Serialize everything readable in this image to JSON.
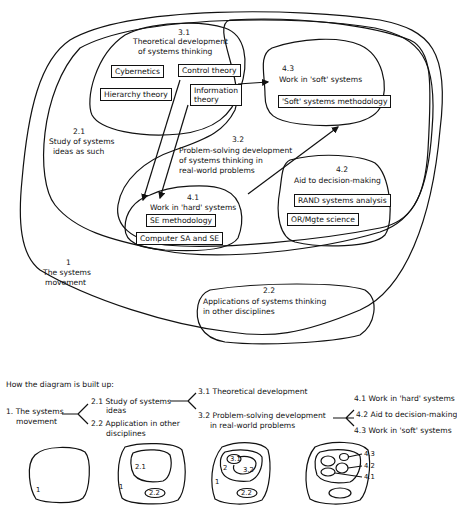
{
  "diagram": {
    "regions": [
      {
        "id": "1",
        "number": "1",
        "label_lines": [
          "The systems",
          "movement"
        ]
      },
      {
        "id": "2.1",
        "number": "2.1",
        "label_lines": [
          "Study of systems",
          "ideas as such"
        ]
      },
      {
        "id": "2.2",
        "number": "2.2",
        "label_lines": [
          "Applications of systems thinking",
          "in other disciplines"
        ]
      },
      {
        "id": "3.1",
        "number": "3.1",
        "label_lines": [
          "Theoretical development",
          "of systems thinking"
        ]
      },
      {
        "id": "3.2",
        "number": "3.2",
        "label_lines": [
          "Problem-solving development",
          "of systems thinking in",
          "real-world problems"
        ]
      },
      {
        "id": "4.1",
        "number": "4.1",
        "label_lines": [
          "Work in 'hard' systems"
        ]
      },
      {
        "id": "4.2",
        "number": "4.2",
        "label_lines": [
          "Aid to decision-making"
        ]
      },
      {
        "id": "4.3",
        "number": "4.3",
        "label_lines": [
          "Work in 'soft' systems"
        ]
      }
    ],
    "boxes": {
      "cybernetics": "Cybernetics",
      "control_theory": "Control theory",
      "hierarchy_theory": "Hierarchy theory",
      "information_theory_1": "Information",
      "information_theory_2": "theory",
      "soft_systems_methodology": "'Soft' systems methodology",
      "se_methodology": "SE methodology",
      "computer_sa_se": "Computer SA and SE",
      "rand_systems_analysis": "RAND systems analysis",
      "or_mgte_science": "OR/Mgte science"
    },
    "arrows": [
      {
        "from": "Control theory",
        "to": "4.1"
      },
      {
        "from": "Information theory",
        "to": "4.1"
      },
      {
        "from": "3.1",
        "to": "4.3"
      },
      {
        "from": "4.1",
        "to": "4.3"
      }
    ]
  },
  "buildup": {
    "heading": "How the diagram is built up:",
    "level1": {
      "line1": "1. The systems",
      "line2": "movement"
    },
    "level2": [
      {
        "line1": "2.1 Study of systems",
        "line2": "ideas"
      },
      {
        "line1": "2.2 Application in other",
        "line2": "disciplines"
      }
    ],
    "level3": [
      {
        "line1": "3.1 Theoretical development",
        "line2": ""
      },
      {
        "line1": "3.2 Problem-solving development",
        "line2": "in real-world problems"
      }
    ],
    "level4": [
      {
        "line1": "4.1 Work in 'hard' systems"
      },
      {
        "line1": "4.2 Aid to decision-making"
      },
      {
        "line1": "4.3 Work in 'soft' systems"
      }
    ],
    "mini_labels": {
      "m1": "1",
      "m2_1": "1",
      "m2_21": "2.1",
      "m2_22": "2.2",
      "m3_1": "1",
      "m3_2": "2",
      "m3_31": "3.1",
      "m3_32": "3.2",
      "m3_22": "2.2",
      "m4_43": "4.3",
      "m4_42": "4.2",
      "m4_41": "4.1"
    }
  }
}
